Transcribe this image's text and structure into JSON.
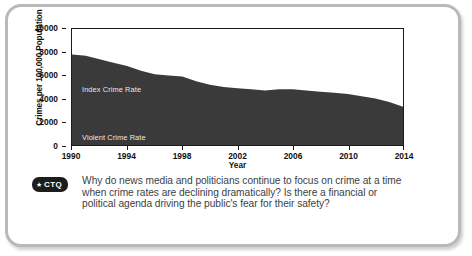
{
  "figure": {
    "chart": {
      "y_axis_title": "Crimes per 100,000 Population",
      "x_axis_title": "Year",
      "series_labels": {
        "index": "Index Crime Rate",
        "violent": "Violent Crime Rate"
      }
    },
    "question": {
      "badge_star": "★",
      "badge_label": "CTQ",
      "text": "Why do news media and politicians continue to focus on crime at a time when crime rates are declining dramatically? Is there a financial or political agenda driving the public's fear for their safety?"
    }
  },
  "colors": {
    "area_fill": "#3a3a3a",
    "axis": "#1a1a1a",
    "frame_border": "#b9b9b9",
    "badge_background": "#1c1c1c",
    "question_text": "#3a3f45",
    "series_label_text": "#e8e8e8"
  },
  "chart_data": {
    "type": "area",
    "title": "",
    "subtitle": "",
    "xlabel": "Year",
    "ylabel": "Crimes per 100,000 Population",
    "xlim": [
      1990,
      2014
    ],
    "ylim": [
      0,
      10000
    ],
    "grid": false,
    "legend": "inline-annotations",
    "xticks": [
      1990,
      1994,
      1998,
      2002,
      2006,
      2010,
      2014
    ],
    "xtick_labels": [
      "1990",
      "1994",
      "1998",
      "2002",
      "2006",
      "2010",
      "2014"
    ],
    "yticks": [
      0,
      2000,
      4000,
      6000,
      8000,
      10000
    ],
    "ytick_labels": [
      "0",
      "2000",
      "4000",
      "6000",
      "8000",
      "10000"
    ],
    "x": [
      1990,
      1991,
      1992,
      1993,
      1994,
      1995,
      1996,
      1997,
      1998,
      1999,
      2000,
      2001,
      2002,
      2003,
      2004,
      2005,
      2006,
      2007,
      2008,
      2009,
      2010,
      2011,
      2012,
      2013,
      2014
    ],
    "series": [
      {
        "name": "Index Crime Rate",
        "values": [
          7800,
          7700,
          7400,
          7100,
          6800,
          6400,
          6100,
          6000,
          5900,
          5500,
          5200,
          5000,
          4900,
          4800,
          4700,
          4800,
          4800,
          4700,
          4600,
          4500,
          4400,
          4200,
          4000,
          3700,
          3300
        ]
      },
      {
        "name": "Violent Crime Rate",
        "values": [
          730,
          760,
          760,
          750,
          720,
          690,
          640,
          610,
          570,
          520,
          510,
          500,
          490,
          480,
          470,
          470,
          480,
          470,
          460,
          430,
          400,
          390,
          390,
          370,
          360
        ]
      }
    ],
    "annotations": [
      {
        "text": "Index Crime Rate",
        "x": 1991,
        "y": 4600
      },
      {
        "text": "Violent Crime Rate",
        "x": 1991,
        "y": 600
      }
    ]
  }
}
